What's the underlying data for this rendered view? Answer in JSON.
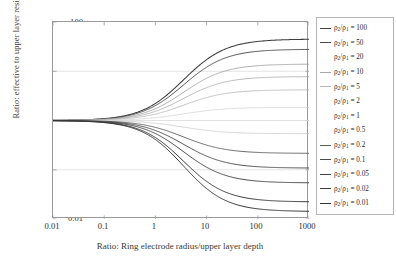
{
  "chart_data": {
    "type": "line",
    "title": "",
    "xlabel": "Ratio: Ring electrode radius/upper layer depth",
    "ylabel": "Ratio: effective to upper layer resistivity, ρₑ/ρ₁",
    "xscale": "log",
    "yscale": "log",
    "xlim": [
      0.01,
      1000
    ],
    "ylim": [
      0.01,
      100
    ],
    "xticks": [
      "0.01",
      "0.1",
      "1",
      "10",
      "100",
      "1000"
    ],
    "yticks": [
      "100",
      "10",
      "1",
      "0.1",
      "0.01"
    ],
    "grid": "horizontal-only",
    "legend_position": "right-outside",
    "legend_title": "",
    "series": [
      {
        "name": "ρ₂/ρ₁ = 100",
        "ratio": 100,
        "label_value": "100",
        "color": "#3c3c3c",
        "width": 1.05,
        "asymptote": 45
      },
      {
        "name": "ρ₂/ρ₁ = 50",
        "ratio": 50,
        "label_value": "50",
        "color": "#4a4a4a",
        "width": 0.95,
        "asymptote": 28
      },
      {
        "name": "ρ₂/ρ₁ = 20",
        "ratio": 20,
        "label_value": "20",
        "color": "#9a9a9a",
        "width": 0.8,
        "asymptote": 14
      },
      {
        "name": "ρ₂/ρ₁ = 10",
        "ratio": 10,
        "label_value": "10",
        "color": "#a8a8a8",
        "width": 0.8,
        "asymptote": 7.8
      },
      {
        "name": "ρ₂/ρ₁ = 5",
        "ratio": 5,
        "label_value": "5",
        "color": "#b5b5b5",
        "width": 0.8,
        "asymptote": 4.2
      },
      {
        "name": "ρ₂/ρ₁ = 2",
        "ratio": 2,
        "label_value": "2",
        "color": "#d2d2d2",
        "width": 0.75,
        "asymptote": 1.85
      },
      {
        "name": "ρ₂/ρ₁ = 1",
        "ratio": 1,
        "label_value": "1",
        "color": "#e0e0e0",
        "width": 0.75,
        "asymptote": 1.0
      },
      {
        "name": "ρ₂/ρ₁ = 0.5",
        "ratio": 0.5,
        "label_value": "0.5",
        "color": "#c8c8c8",
        "width": 0.75,
        "asymptote": 0.54
      },
      {
        "name": "ρ₂/ρ₁ = 0.2",
        "ratio": 0.2,
        "label_value": "0.2",
        "color": "#5a5a5a",
        "width": 0.9,
        "asymptote": 0.215
      },
      {
        "name": "ρ₂/ρ₁ = 0.1",
        "ratio": 0.1,
        "label_value": "0.1",
        "color": "#4a4a4a",
        "width": 0.95,
        "asymptote": 0.108
      },
      {
        "name": "ρ₂/ρ₁ = 0.05",
        "ratio": 0.05,
        "label_value": "0.05",
        "color": "#424242",
        "width": 0.95,
        "asymptote": 0.054
      },
      {
        "name": "ρ₂/ρ₁ = 0.02",
        "ratio": 0.02,
        "label_value": "0.02",
        "color": "#3a3a3a",
        "width": 1.0,
        "asymptote": 0.0222
      },
      {
        "name": "ρ₂/ρ₁ = 0.01",
        "ratio": 0.01,
        "label_value": "0.01",
        "color": "#353535",
        "width": 1.0,
        "asymptote": 0.0142
      }
    ]
  },
  "axes": {
    "x_title": "Ratio: Ring electrode radius/upper layer depth",
    "y_title": "Ratio: effective to upper layer resistivity, ρₑ/ρ₁",
    "x_tick_labels": [
      "0.01",
      "0.1",
      "1",
      "10",
      "100",
      "1000"
    ],
    "y_tick_labels": [
      "100",
      "10",
      "1",
      "0.1",
      "0.01"
    ]
  },
  "legend": {
    "entries": [
      {
        "prefix": "ρ",
        "sub1": "2",
        "mid": "/ρ",
        "sub2": "1",
        "eq": " = ",
        "value": "100",
        "full": "ρ₂/ρ₁ = 100",
        "show_sample": true
      },
      {
        "prefix": "ρ",
        "sub1": "2",
        "mid": "/ρ",
        "sub2": "1",
        "eq": " = ",
        "value": "50",
        "full": "ρ₂/ρ₁ = 50",
        "show_sample": true
      },
      {
        "prefix": "ρ",
        "sub1": "2",
        "mid": "/ρ",
        "sub2": "1",
        "eq": " = ",
        "value": "20",
        "full": "ρ₂/ρ₁ = 20",
        "show_sample": false
      },
      {
        "prefix": "ρ",
        "sub1": "2",
        "mid": "/ρ",
        "sub2": "1",
        "eq": " = ",
        "value": "10",
        "full": "ρ₂/ρ₁ = 10",
        "show_sample": true
      },
      {
        "prefix": "ρ",
        "sub1": "2",
        "mid": "/ρ",
        "sub2": "1",
        "eq": " = ",
        "value": "5",
        "full": "ρ₂/ρ₁ = 5",
        "show_sample": true
      },
      {
        "prefix": "ρ",
        "sub1": "2",
        "mid": "/ρ",
        "sub2": "1",
        "eq": " = ",
        "value": "2",
        "full": "ρ₂/ρ₁ = 2",
        "show_sample": false
      },
      {
        "prefix": "ρ",
        "sub1": "2",
        "mid": "/ρ",
        "sub2": "1",
        "eq": " = ",
        "value": "1",
        "full": "ρ₂/ρ₁ = 1",
        "show_sample": false
      },
      {
        "prefix": "ρ",
        "sub1": "2",
        "mid": "/ρ",
        "sub2": "1",
        "eq": " = ",
        "value": "0.5",
        "full": "ρ₂/ρ₁ = 0.5",
        "show_sample": false
      },
      {
        "prefix": "ρ",
        "sub1": "2",
        "mid": "/ρ",
        "sub2": "1",
        "eq": " = ",
        "value": "0.2",
        "full": "ρ₂/ρ₁ = 0.2",
        "show_sample": true
      },
      {
        "prefix": "ρ",
        "sub1": "2",
        "mid": "/ρ",
        "sub2": "1",
        "eq": " = ",
        "value": "0.1",
        "full": "ρ₂/ρ₁ = 0.1",
        "show_sample": true
      },
      {
        "prefix": "ρ",
        "sub1": "2",
        "mid": "/ρ",
        "sub2": "1",
        "eq": " = ",
        "value": "0.05",
        "full": "ρ₂/ρ₁ = 0.05",
        "show_sample": true
      },
      {
        "prefix": "ρ",
        "sub1": "2",
        "mid": "/ρ",
        "sub2": "1",
        "eq": " = ",
        "value": "0.02",
        "full": "ρ₂/ρ₁ = 0.02",
        "show_sample": true
      },
      {
        "prefix": "ρ",
        "sub1": "2",
        "mid": "/ρ",
        "sub2": "1",
        "eq": " = ",
        "value": "0.01",
        "full": "ρ₂/ρ₁ = 0.01",
        "show_sample": true
      }
    ]
  },
  "colors": {
    "frame": "#9a9a9a",
    "grid": "#d8d8d8",
    "text": "#2b2b2b",
    "background": "#ffffff"
  }
}
